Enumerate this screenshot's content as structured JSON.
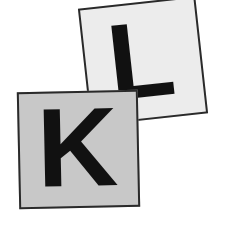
{
  "scene": {
    "name": "letter-tiles-photo",
    "background_color": "#ffffff",
    "width": 227,
    "height": 227,
    "description": "Two overlapping square letter tiles photographed at slight angles"
  },
  "tiles": [
    {
      "id": "tile-l",
      "letter": "L",
      "face_color": "#ececec",
      "border_color": "#2a2a2a",
      "letter_color": "#111111",
      "rotation_deg": -6.3,
      "stacking": "back",
      "position": {
        "left": 84,
        "top": 2,
        "width": 118,
        "height": 118
      }
    },
    {
      "id": "tile-k",
      "letter": "K",
      "face_color": "#c8c8c8",
      "border_color": "#2a2a2a",
      "letter_color": "#111111",
      "rotation_deg": -1.2,
      "stacking": "front",
      "position": {
        "left": 18,
        "top": 91,
        "width": 121,
        "height": 117
      }
    }
  ]
}
